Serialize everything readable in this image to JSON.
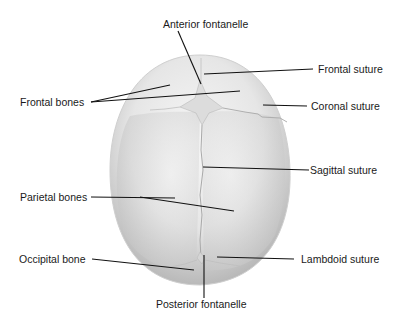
{
  "diagram": {
    "labels": {
      "anterior_fontanelle": "Anterior fontanelle",
      "frontal_suture": "Frontal  suture",
      "frontal_bones": "Frontal bones",
      "coronal_suture": "Coronal suture",
      "sagittal_suture": "Sagittal  suture",
      "parietal_bones": "Parietal bones",
      "occipital_bone": "Occipital bone",
      "lambdoid_suture": "Lambdoid suture",
      "posterior_fontanelle": "Posterior fontanelle"
    },
    "colors": {
      "background": "#ffffff",
      "bone_light": "#f2f2f2",
      "bone_shade": "#bdbdbd",
      "leader_line": "#111111",
      "text": "#1a1a1a"
    }
  }
}
